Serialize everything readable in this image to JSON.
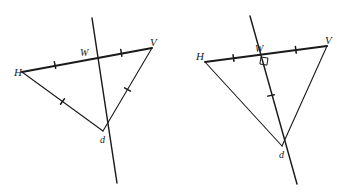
{
  "figure": {
    "stroke_color": "#1a1a1a",
    "background_color": "#ffffff",
    "diagrams": [
      {
        "id": "left",
        "name": "triangle-cevian-diagram",
        "caption": "Triangle H V d with line through W on HV, no right angle marked",
        "vertices": [
          {
            "key": "H",
            "label": "H",
            "x": 22,
            "y": 72
          },
          {
            "key": "V",
            "label": "V",
            "x": 152,
            "y": 48
          },
          {
            "key": "W",
            "label": "W",
            "x": 88,
            "y": 58
          },
          {
            "key": "d",
            "label": "d",
            "x": 103,
            "y": 131
          }
        ],
        "label_positions": [
          {
            "key": "H",
            "x": 14,
            "y": 76
          },
          {
            "key": "V",
            "x": 150,
            "y": 46
          },
          {
            "key": "W",
            "x": 80,
            "y": 56
          },
          {
            "key": "d",
            "x": 100,
            "y": 143
          }
        ],
        "segments": [
          {
            "from": "H",
            "to": "V",
            "weight": "thick",
            "ticks": 0
          },
          {
            "from": "H",
            "to": "d",
            "weight": "thin",
            "ticks": 0
          },
          {
            "from": "V",
            "to": "d",
            "weight": "thin",
            "ticks": 0
          }
        ],
        "transversal": {
          "x1": 92,
          "y1": 18,
          "x2": 117,
          "y2": 183,
          "weight": "med"
        },
        "tick_marks": [
          {
            "on": "H-W",
            "t": 0.5
          },
          {
            "on": "W-V",
            "t": 0.52
          },
          {
            "on": "H-d",
            "t": 0.5
          },
          {
            "on": "V-d",
            "t": 0.5
          }
        ],
        "right_angle": null
      },
      {
        "id": "right",
        "name": "triangle-perpendicular-bisector-diagram",
        "caption": "Triangle H V d with perpendicular bisector through W on HV, right angle marked at W",
        "vertices": [
          {
            "key": "H",
            "label": "H",
            "x": 205,
            "y": 62
          },
          {
            "key": "V",
            "label": "V",
            "x": 327,
            "y": 46
          },
          {
            "key": "W",
            "label": "W",
            "x": 262,
            "y": 54
          },
          {
            "key": "d",
            "label": "d",
            "x": 282,
            "y": 146
          }
        ],
        "label_positions": [
          {
            "key": "H",
            "x": 196,
            "y": 60
          },
          {
            "key": "V",
            "x": 325,
            "y": 44
          },
          {
            "key": "W",
            "x": 255,
            "y": 52
          },
          {
            "key": "d",
            "x": 279,
            "y": 158
          }
        ],
        "segments": [
          {
            "from": "H",
            "to": "V",
            "weight": "thick",
            "ticks": 0
          },
          {
            "from": "H",
            "to": "d",
            "weight": "thin",
            "ticks": 0
          },
          {
            "from": "V",
            "to": "d",
            "weight": "thin",
            "ticks": 0
          }
        ],
        "transversal": {
          "x1": 250,
          "y1": 16,
          "x2": 297,
          "y2": 184,
          "weight": "med"
        },
        "tick_marks": [
          {
            "on": "H-W",
            "t": 0.5
          },
          {
            "on": "W-V",
            "t": 0.52
          },
          {
            "on": "W-d",
            "t": 0.45
          }
        ],
        "right_angle": {
          "x": 262,
          "y": 54,
          "size": 7
        }
      }
    ]
  }
}
